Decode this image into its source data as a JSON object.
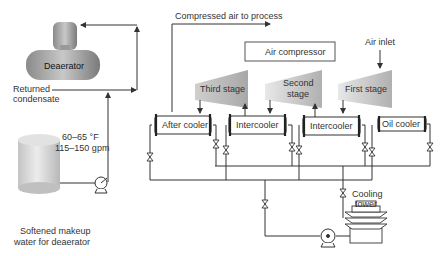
{
  "diagram": {
    "labels": {
      "deaerator": "Deaerator",
      "returned_condensate_1": "Returned",
      "returned_condensate_2": "condensate",
      "temp": "60–65 °F",
      "flow": "115–150 gpm",
      "makeup_1": "Softened makeup",
      "makeup_2": "water for deaerator",
      "compressed_air": "Compressed air to process",
      "air_compressor": "Air compressor",
      "air_inlet": "Air inlet",
      "third_stage": "Third stage",
      "second_stage_1": "Second",
      "second_stage_2": "stage",
      "first_stage": "First stage",
      "after_cooler": "After cooler",
      "intercooler_1": "Intercooler",
      "intercooler_2": "Intercooler",
      "oil_cooler": "Oil cooler",
      "cooling_tower_1": "Cooling",
      "cooling_tower_2": "tower"
    }
  }
}
